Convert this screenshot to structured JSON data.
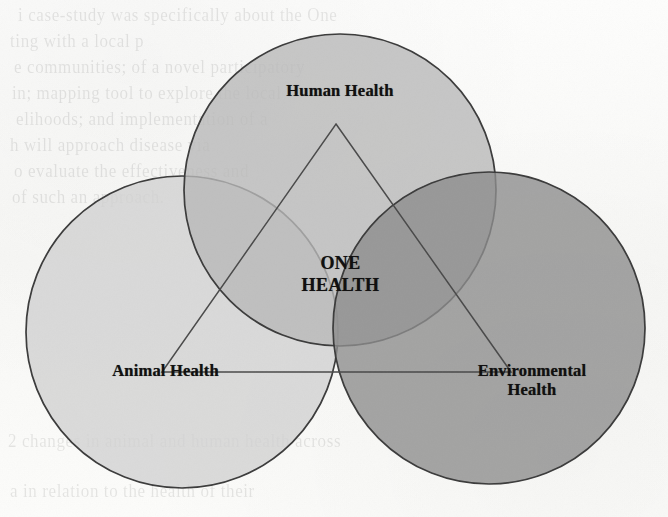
{
  "page": {
    "width": 668,
    "height": 517,
    "background_color": "#fbfbfa",
    "media": "scanned book page",
    "bleed_through_lines": [
      "i case-study was specifically about the One",
      "ting with a local p",
      "e communities; of a novel participatory",
      "in; mapping tool to explore the local",
      "elihoods; and implementation of a",
      "h will approach disease via",
      "o evaluate the effectiveness and",
      "of such an approach.",
      "2 changes in animal and human health across",
      "a in relation to the health of their"
    ]
  },
  "diagram": {
    "type": "venn-3-circle-with-inscribed-triangle",
    "title": "One Health",
    "center_label": "ONE\nHEALTH",
    "center_label_lines": [
      "ONE",
      "HEALTH"
    ],
    "stroke_color": "#3a3a3a",
    "stroke_width": 1.6,
    "label_color": "#111010",
    "circles": [
      {
        "id": "human",
        "label": "Human Health",
        "cx": 340,
        "cy": 190,
        "r": 156,
        "fill": "#b9b9b9",
        "opacity": 0.82,
        "label_x": 340,
        "label_y": 95
      },
      {
        "id": "animal",
        "label": "Animal Health",
        "cx": 182,
        "cy": 332,
        "r": 156,
        "fill": "#d2d2d2",
        "opacity": 0.82,
        "label_x": 165,
        "label_y": 375
      },
      {
        "id": "environmental",
        "label": "Environmental\nHealth",
        "label_lines": [
          "Environmental",
          "Health"
        ],
        "cx": 489,
        "cy": 328,
        "r": 156,
        "fill": "#8d8d8d",
        "opacity": 0.82,
        "label_x": 532,
        "label_y": 375
      }
    ],
    "triangle": {
      "id": "one-health-triangle",
      "apex": {
        "x": 336,
        "y": 124
      },
      "base_left": {
        "x": 162,
        "y": 372
      },
      "base_right": {
        "x": 511,
        "y": 372
      },
      "fill": "none",
      "stroke": "#4a4a4a",
      "stroke_width": 1.4
    }
  }
}
